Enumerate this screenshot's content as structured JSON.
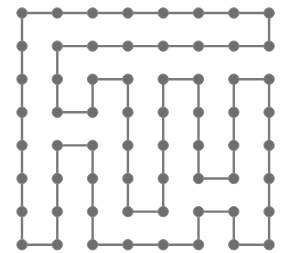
{
  "diagram": {
    "type": "grid-graph-hamiltonian-cycle",
    "grid": {
      "cols": 8,
      "rows": 8
    },
    "layout": {
      "x0": 22,
      "y0": 13,
      "dx": 35.3,
      "dy": 33.1,
      "node_radius": 5.2
    },
    "colors": {
      "edge": "#7a7a7a",
      "node": "#6e6e6e",
      "background": "#ffffff"
    },
    "path": [
      [
        0,
        0
      ],
      [
        0,
        1
      ],
      [
        0,
        2
      ],
      [
        0,
        3
      ],
      [
        0,
        4
      ],
      [
        0,
        5
      ],
      [
        0,
        6
      ],
      [
        0,
        7
      ],
      [
        1,
        7
      ],
      [
        1,
        6
      ],
      [
        1,
        5
      ],
      [
        1,
        4
      ],
      [
        2,
        4
      ],
      [
        2,
        5
      ],
      [
        2,
        6
      ],
      [
        2,
        7
      ],
      [
        3,
        7
      ],
      [
        4,
        7
      ],
      [
        5,
        7
      ],
      [
        5,
        6
      ],
      [
        6,
        6
      ],
      [
        6,
        7
      ],
      [
        7,
        7
      ],
      [
        7,
        6
      ],
      [
        7,
        5
      ],
      [
        7,
        4
      ],
      [
        7,
        3
      ],
      [
        7,
        2
      ],
      [
        6,
        2
      ],
      [
        6,
        3
      ],
      [
        6,
        4
      ],
      [
        6,
        5
      ],
      [
        5,
        5
      ],
      [
        5,
        4
      ],
      [
        5,
        3
      ],
      [
        5,
        2
      ],
      [
        4,
        2
      ],
      [
        4,
        3
      ],
      [
        4,
        4
      ],
      [
        4,
        5
      ],
      [
        4,
        6
      ],
      [
        3,
        6
      ],
      [
        3,
        5
      ],
      [
        3,
        4
      ],
      [
        3,
        3
      ],
      [
        3,
        2
      ],
      [
        2,
        2
      ],
      [
        2,
        3
      ],
      [
        1,
        3
      ],
      [
        1,
        2
      ],
      [
        1,
        1
      ],
      [
        2,
        1
      ],
      [
        3,
        1
      ],
      [
        4,
        1
      ],
      [
        5,
        1
      ],
      [
        6,
        1
      ],
      [
        7,
        1
      ],
      [
        7,
        0
      ],
      [
        6,
        0
      ],
      [
        5,
        0
      ],
      [
        4,
        0
      ],
      [
        3,
        0
      ],
      [
        2,
        0
      ],
      [
        1,
        0
      ],
      [
        0,
        0
      ]
    ],
    "closed": true
  }
}
